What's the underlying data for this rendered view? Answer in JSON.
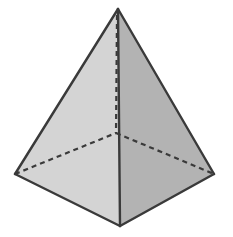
{
  "diagram": {
    "type": "square-pyramid",
    "vertices": {
      "apex": [
        118,
        9
      ],
      "left": [
        15,
        174
      ],
      "right": [
        214,
        174
      ],
      "front": [
        120,
        226
      ],
      "back_hidden": [
        116,
        133
      ]
    },
    "faces": {
      "left_face_color": "#d4d4d4",
      "right_face_color": "#b3b3b3"
    },
    "edge_color": "#3a3a3a",
    "hidden_edge_color": "#3a3a3a",
    "background_color": "#ffffff"
  }
}
